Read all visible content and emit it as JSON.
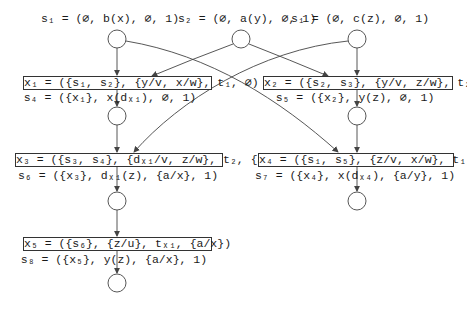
{
  "diagram": {
    "type": "causal net / unfolding",
    "states": [
      {
        "id": "s1_top_left",
        "label": "s₁ = (∅, b(x), ∅, 1)"
      },
      {
        "id": "s2_top",
        "label": "s₂ = (∅, a(y), ∅, 1)"
      },
      {
        "id": "s1_top_right",
        "label": "s₁ = (∅, c(z), ∅, 1)"
      },
      {
        "id": "s4",
        "label": "s₄ = ({x₁}, x(dₓ₁), ∅, 1)"
      },
      {
        "id": "s5",
        "label": "s₅ = ({x₂}, y(z), ∅, 1)"
      },
      {
        "id": "s6",
        "label": "s₆ = ({x₃}, dₓ₁(z), {a/x}, 1)"
      },
      {
        "id": "s7",
        "label": "s₇ = ({x₄}, x(dₓ₄), {a/y}, 1)"
      },
      {
        "id": "s8",
        "label": "s₈ = ({x₅}, y(z), {a/x}, 1)"
      }
    ],
    "transitions": [
      {
        "id": "x1",
        "label": "x₁ = ({s₁, s₂}, {y/v, x/w}, t₁, ∅)"
      },
      {
        "id": "x2",
        "label": "x₂ = ({s₂, s₃}, {y/v, z/w}, t₂, ∅)"
      },
      {
        "id": "x3",
        "label": "x₃ = ({s₃, s₄}, {dₓ₁/v, z/w}, t₂, {a/x})"
      },
      {
        "id": "x4",
        "label": "x₄ = ({s₁, s₅}, {z/v, x/w}, t₁, {a/y})"
      },
      {
        "id": "x5",
        "label": "x₅ = ({s₆}, {z/u}, tₓ₁, {a/x})"
      }
    ],
    "edges": [
      [
        "s1_top_left",
        "x1"
      ],
      [
        "s2_top",
        "x1"
      ],
      [
        "s2_top",
        "x2"
      ],
      [
        "s1_top_right",
        "x2"
      ],
      [
        "s1_top_left",
        "x4"
      ],
      [
        "s1_top_right",
        "x3"
      ],
      [
        "x1",
        "s4"
      ],
      [
        "x2",
        "s5"
      ],
      [
        "s4",
        "x3"
      ],
      [
        "s5",
        "x4"
      ],
      [
        "x3",
        "s6"
      ],
      [
        "x4",
        "s7"
      ],
      [
        "s6",
        "x5"
      ],
      [
        "x5",
        "s8"
      ]
    ]
  }
}
